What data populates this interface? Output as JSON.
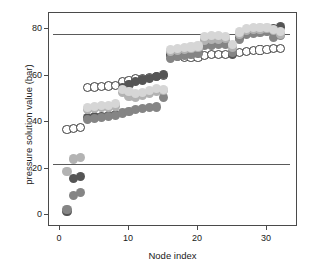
{
  "chart_data": {
    "type": "scatter",
    "title": "",
    "xlabel": "Node index",
    "ylabel": "pressure solution value (bar)",
    "xlim": [
      -1.6,
      34.5
    ],
    "ylim": [
      -5,
      87
    ],
    "xticks": [
      0,
      10,
      20,
      30
    ],
    "xtick_labels": [
      "0",
      "10",
      "20",
      "30"
    ],
    "yticks": [
      0,
      20,
      40,
      60,
      80
    ],
    "ytick_labels": [
      "0",
      "20",
      "40",
      "60",
      "80"
    ],
    "grid": false,
    "legend": "none",
    "reference_lines": [
      {
        "name": "upper-pressure-limit",
        "y": 78,
        "color": "#5a5a5a"
      },
      {
        "name": "lower-pressure-limit",
        "y": 22,
        "color": "#5a5a5a"
      }
    ],
    "marker_size": 4.6,
    "series": [
      {
        "name": "solution-open",
        "marker": "open-circle",
        "color": "#ffffff",
        "edge_color": "#3a3a3a",
        "x": [
          1,
          2,
          3,
          4,
          5,
          6,
          7,
          8,
          9,
          10,
          11,
          12,
          13,
          14,
          15,
          16,
          17,
          18,
          19,
          20,
          21,
          22,
          23,
          24,
          25,
          26,
          27,
          28,
          29,
          30,
          31,
          32
        ],
        "y": [
          36.8,
          37.2,
          37.6,
          55.0,
          55.2,
          55.4,
          55.6,
          55.9,
          57.5,
          58.0,
          58.6,
          59.0,
          59.4,
          59.8,
          60.2,
          68.6,
          68.2,
          68.0,
          67.9,
          67.9,
          68.8,
          69.0,
          69.2,
          69.1,
          69.6,
          70.0,
          70.4,
          70.8,
          71.1,
          71.3,
          71.6,
          71.8
        ]
      },
      {
        "name": "solution-dark",
        "marker": "filled-circle",
        "color": "#555555",
        "x": [
          1,
          2,
          3,
          4,
          5,
          6,
          7,
          8,
          9,
          10,
          11,
          12,
          13,
          14,
          15,
          16,
          17,
          18,
          19,
          20,
          21,
          22,
          23,
          24,
          25,
          26,
          27,
          28,
          29,
          30,
          31,
          32
        ],
        "y": [
          1.8,
          15.8,
          16.6,
          42.0,
          42.3,
          42.6,
          43.0,
          43.4,
          55.0,
          56.4,
          57.4,
          58.2,
          59.0,
          59.8,
          60.4,
          69.2,
          69.4,
          69.6,
          69.8,
          70.0,
          73.6,
          73.8,
          74.0,
          74.2,
          69.0,
          76.4,
          78.8,
          79.2,
          79.6,
          80.0,
          80.4,
          81.0
        ]
      },
      {
        "name": "solution-medium",
        "marker": "filled-circle",
        "color": "#858585",
        "x": [
          1,
          2,
          3,
          4,
          5,
          6,
          7,
          8,
          9,
          10,
          11,
          12,
          13,
          14,
          15,
          16,
          17,
          18,
          19,
          20,
          21,
          22,
          23,
          24,
          25,
          26,
          27,
          28,
          29,
          30,
          31,
          32
        ],
        "y": [
          2.4,
          8.6,
          9.8,
          41.2,
          41.6,
          42.0,
          42.4,
          42.8,
          44.0,
          44.8,
          45.6,
          45.8,
          46.2,
          46.6,
          50.8,
          67.6,
          68.4,
          68.8,
          69.2,
          69.6,
          73.0,
          73.2,
          73.4,
          73.6,
          70.2,
          75.6,
          77.6,
          78.2,
          78.6,
          79.0,
          76.6,
          77.4
        ]
      },
      {
        "name": "solution-light",
        "marker": "filled-circle",
        "color": "#b3b3b3",
        "x": [
          1,
          2,
          3,
          4,
          5,
          6,
          7,
          8,
          9,
          10,
          11,
          12,
          13,
          14,
          15,
          16,
          17,
          18,
          19,
          20,
          21,
          22,
          23,
          24,
          25,
          26,
          27,
          28,
          29,
          30,
          31,
          32
        ],
        "y": [
          19.0,
          24.2,
          24.8,
          45.6,
          46.0,
          46.2,
          46.6,
          47.0,
          52.8,
          51.2,
          50.6,
          51.4,
          52.4,
          53.2,
          53.8,
          70.6,
          71.0,
          71.4,
          71.8,
          72.0,
          75.4,
          75.6,
          75.8,
          76.0,
          72.4,
          77.6,
          79.4,
          79.8,
          80.0,
          80.2,
          79.4,
          78.0
        ]
      },
      {
        "name": "solution-pale",
        "marker": "filled-circle",
        "color": "#d6d6d6",
        "x": [
          4,
          5,
          6,
          7,
          8,
          9,
          10,
          11,
          12,
          13,
          14,
          15,
          16,
          17,
          18,
          19,
          20,
          21,
          22,
          23,
          24,
          25,
          26,
          27,
          28,
          29,
          30,
          31,
          32
        ],
        "y": [
          46.4,
          46.8,
          47.2,
          47.4,
          48.2,
          54.2,
          53.4,
          52.4,
          52.8,
          53.6,
          54.6,
          54.0,
          71.4,
          71.8,
          72.2,
          72.4,
          72.8,
          77.0,
          77.2,
          77.4,
          77.0,
          73.4,
          78.8,
          80.2,
          80.6,
          80.8,
          80.6,
          80.0,
          79.0
        ]
      }
    ]
  }
}
